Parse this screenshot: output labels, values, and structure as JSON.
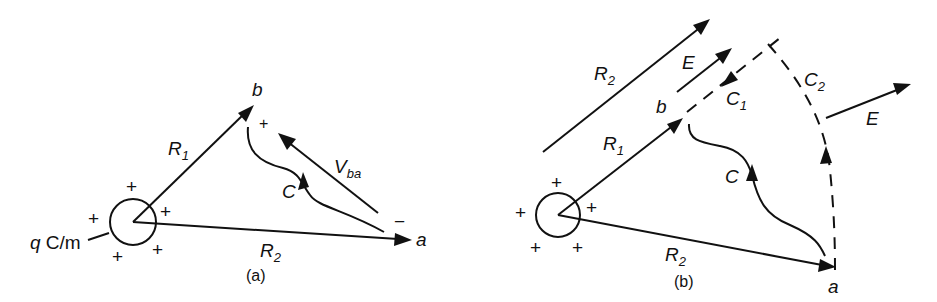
{
  "figure_a": {
    "caption": "(a)",
    "line_charge_label": "q C/m",
    "point_b": "b",
    "point_a": "a",
    "r1": {
      "base": "R",
      "sub": "1"
    },
    "r2": {
      "base": "R",
      "sub": "2"
    },
    "path_c": "C",
    "voltage": {
      "base": "V",
      "sub": "ba"
    },
    "plus_sign": "+",
    "minus_sign": "−",
    "charges": [
      "+",
      "+",
      "+",
      "+",
      "+"
    ]
  },
  "figure_b": {
    "caption": "(b)",
    "point_b": "b",
    "point_a": "a",
    "r1": {
      "base": "R",
      "sub": "1"
    },
    "r2": {
      "base": "R",
      "sub": "2"
    },
    "r2_parallel": {
      "base": "R",
      "sub": "2"
    },
    "e_field_upper": "E",
    "e_field_right": "E",
    "path_c": "C",
    "path_c1": {
      "base": "C",
      "sub": "1"
    },
    "path_c2": {
      "base": "C",
      "sub": "2"
    },
    "charges": [
      "+",
      "+",
      "+",
      "+",
      "+"
    ]
  }
}
